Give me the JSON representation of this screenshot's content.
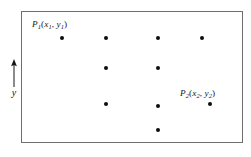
{
  "figure": {
    "name": "scatter-point-diagram",
    "background_color": "#ffffff",
    "frame": {
      "border_color": "#6e6e6e",
      "x": 21,
      "y": 11,
      "width": 222,
      "height": 132
    }
  },
  "axis": {
    "label": "y",
    "direction": "up",
    "arrow_color": "#161616"
  },
  "labels": [
    {
      "id": "P1",
      "base": "P",
      "base_sub": "1",
      "open": "(",
      "arg1": "x",
      "arg1_sub": "1",
      "comma": ",",
      "arg2": "y",
      "arg2_sub": "1",
      "close": ")",
      "text": "P1(x1, y1)",
      "x": 32,
      "y": 20
    },
    {
      "id": "P2",
      "base": "P",
      "base_sub": "2",
      "open": "(",
      "arg1": "x",
      "arg1_sub": "2",
      "comma": ",",
      "arg2": "y",
      "arg2_sub": "2",
      "close": ")",
      "text": "P2(x2, y2)",
      "x": 180,
      "y": 89
    }
  ],
  "chart_data": {
    "type": "scatter",
    "title": "",
    "xlabel": "",
    "ylabel": "y",
    "grid": false,
    "legend": "none",
    "marker_color": "#0d0d0d",
    "marker_size": 4.4,
    "axis_ranges": {
      "x": [
        21,
        243
      ],
      "y": [
        11,
        143
      ]
    },
    "note": "Pixel coordinates within the framed plot area; y increases upward per the axis arrow.",
    "points": [
      {
        "name": "P1",
        "px": 62,
        "py": 38,
        "labeled": true
      },
      {
        "name": "",
        "px": 106,
        "py": 38,
        "labeled": false
      },
      {
        "name": "",
        "px": 158,
        "py": 38,
        "labeled": false
      },
      {
        "name": "",
        "px": 202,
        "py": 38,
        "labeled": false
      },
      {
        "name": "",
        "px": 106,
        "py": 68,
        "labeled": false
      },
      {
        "name": "",
        "px": 158,
        "py": 68,
        "labeled": false
      },
      {
        "name": "",
        "px": 106,
        "py": 104,
        "labeled": false
      },
      {
        "name": "",
        "px": 158,
        "py": 106,
        "labeled": false
      },
      {
        "name": "P2",
        "px": 210,
        "py": 104,
        "labeled": true
      },
      {
        "name": "",
        "px": 158,
        "py": 130,
        "labeled": false
      }
    ]
  }
}
